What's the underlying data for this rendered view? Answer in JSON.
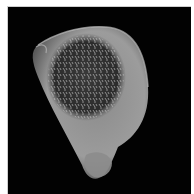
{
  "image": {
    "subject": "micrograph of a seed/pollen-like specimen with a textured, spiny central surface",
    "colors": {
      "background": "#020202",
      "border": "#ffffff",
      "body_light": "#9a9a9a",
      "body_mid": "#6e6e6e",
      "texture_dark": "#2a2a2a",
      "texture_light": "#d8d8d8"
    }
  }
}
